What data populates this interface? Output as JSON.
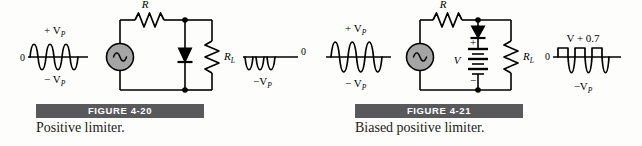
{
  "background_color": "#fdfdfc",
  "ink_color": "#000000",
  "figure_bar_color": "#59595b",
  "figure_bar_text_color": "#ffffff",
  "source_fill_color": "#9e9e9e",
  "figures": [
    {
      "id": "figure-4-20",
      "bar_label": "FIGURE 4-20",
      "caption": "Positive limiter.",
      "input_waveform": {
        "type": "sine",
        "cycles": 3,
        "zero_label": "0",
        "peak_positive_label": "+ V",
        "peak_positive_sub": "P",
        "peak_negative_label": "− V",
        "peak_negative_sub": "P"
      },
      "output_waveform": {
        "type": "positive-clipped-sine",
        "cycles": 3,
        "zero_label": "0",
        "peak_negative_label": "−V",
        "peak_negative_sub": "P"
      },
      "components": [
        {
          "name": "ac-source",
          "symbol": "sine-in-circle",
          "label": ""
        },
        {
          "name": "series-resistor",
          "symbol": "zigzag",
          "label": "R",
          "sub": ""
        },
        {
          "name": "shunt-diode",
          "symbol": "diode",
          "orientation": "cathode-down",
          "label": ""
        },
        {
          "name": "load-resistor",
          "symbol": "zigzag",
          "label": "R",
          "sub": "L"
        }
      ]
    },
    {
      "id": "figure-4-21",
      "bar_label": "FIGURE 4-21",
      "caption": "Biased positive limiter.",
      "input_waveform": {
        "type": "sine",
        "cycles": 3,
        "zero_label": "",
        "peak_positive_label": "+ V",
        "peak_positive_sub": "P",
        "peak_negative_label": "− V",
        "peak_negative_sub": "P"
      },
      "output_waveform": {
        "type": "biased-clipped-sine",
        "cycles": 3,
        "zero_label": "0",
        "clip_level_label": "V + 0.7",
        "peak_negative_label": "−V",
        "peak_negative_sub": "P"
      },
      "components": [
        {
          "name": "ac-source",
          "symbol": "sine-in-circle",
          "label": ""
        },
        {
          "name": "series-resistor",
          "symbol": "zigzag",
          "label": "R",
          "sub": ""
        },
        {
          "name": "shunt-diode",
          "symbol": "diode",
          "orientation": "cathode-down",
          "label": ""
        },
        {
          "name": "bias-battery",
          "symbol": "battery",
          "label": "V",
          "plus_label": "+",
          "minus_label": "−"
        },
        {
          "name": "load-resistor",
          "symbol": "zigzag",
          "label": "R",
          "sub": "L"
        }
      ]
    }
  ]
}
